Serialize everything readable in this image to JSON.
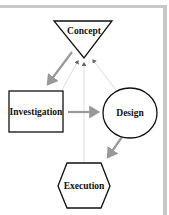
{
  "diagram": {
    "nodes": [
      {
        "id": "concept",
        "label": "Concept",
        "shape": "inverted-triangle"
      },
      {
        "id": "investigation",
        "label": "Investigation",
        "shape": "rectangle"
      },
      {
        "id": "design",
        "label": "Design",
        "shape": "ellipse"
      },
      {
        "id": "execution",
        "label": "Execution",
        "shape": "hexagon"
      }
    ],
    "edges": [
      {
        "from": "concept",
        "to": "investigation",
        "style": "solid-gray"
      },
      {
        "from": "investigation",
        "to": "design",
        "style": "solid-gray"
      },
      {
        "from": "design",
        "to": "execution",
        "style": "solid-gray"
      },
      {
        "from": "investigation",
        "to": "concept",
        "style": "faint-feedback"
      },
      {
        "from": "execution",
        "to": "concept",
        "style": "faint-feedback"
      },
      {
        "from": "design",
        "to": "concept",
        "style": "faint-feedback"
      }
    ],
    "colors": {
      "outline": "#111111",
      "arrow": "#999999",
      "feedback": "#dddddd",
      "frame": "#c8c8c8"
    }
  }
}
